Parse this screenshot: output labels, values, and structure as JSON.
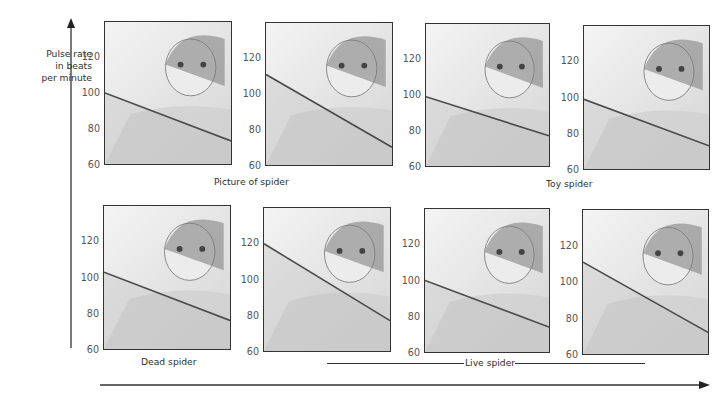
{
  "y_axis": {
    "label": "Pulse rate\nin beats\nper minute",
    "ticks": [
      "120",
      "100",
      "80",
      "60"
    ]
  },
  "captions": {
    "picture": "Picture of spider",
    "toy": "Toy spider",
    "dead": "Dead spider",
    "live": "Live spider"
  },
  "x_axis": {
    "label": ""
  },
  "chart_data": {
    "type": "line",
    "title": "",
    "ylabel": "Pulse rate in beats per minute",
    "xlabel": "",
    "ylim": [
      60,
      140
    ],
    "yticks": [
      60,
      80,
      100,
      120
    ],
    "grid": false,
    "panels": [
      {
        "stimulus": "Picture of spider",
        "scene": "Girl recoils from a spider picture on the wall",
        "pulse_start": 100,
        "pulse_end": 73
      },
      {
        "stimulus": "Picture of spider",
        "scene": "Boy points at a spider picture",
        "pulse_start": 111,
        "pulse_end": 70
      },
      {
        "stimulus": "Toy spider",
        "scene": "Toy spider dangled in front of girl",
        "pulse_start": 99,
        "pulse_end": 77
      },
      {
        "stimulus": "Toy spider",
        "scene": "Girl holds out hand toward toy spider",
        "pulse_start": 99,
        "pulse_end": 73
      },
      {
        "stimulus": "Dead spider",
        "scene": "Girl handles a dead spider",
        "pulse_start": 103,
        "pulse_end": 76
      },
      {
        "stimulus": "Live spider",
        "scene": "Boy watches a live spider in a box",
        "pulse_start": 120,
        "pulse_end": 77
      },
      {
        "stimulus": "Live spider",
        "scene": "Live spider on boy's hand",
        "pulse_start": 100,
        "pulse_end": 74
      },
      {
        "stimulus": "Live spider",
        "scene": "Girl holds a live spider near her face",
        "pulse_start": 111,
        "pulse_end": 72
      }
    ]
  }
}
